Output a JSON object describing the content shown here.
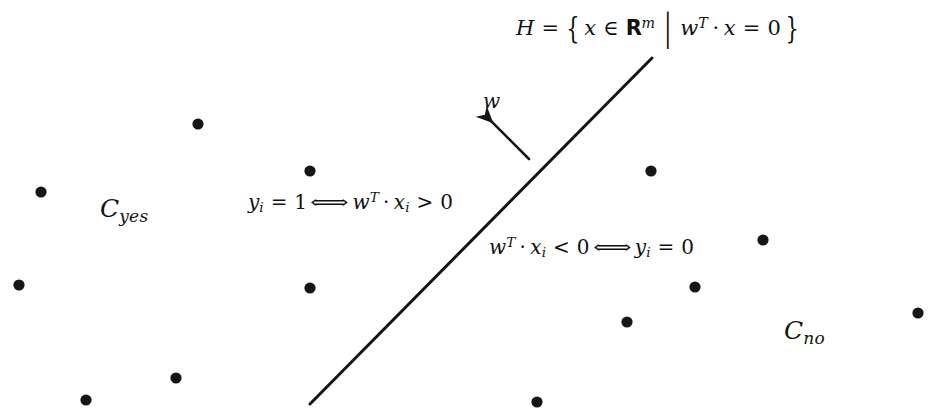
{
  "figure": {
    "title_note": "Linear classifier separating hyperplane diagram",
    "background_color": "#ffffff",
    "ink_color": "#111111",
    "labels": {
      "hyperplane": {
        "H": "H",
        "eq": "=",
        "brace_open": "{",
        "x": "x",
        "in": "∈",
        "R": "R",
        "m": "m",
        "vbar": "|",
        "w": "w",
        "T": "T",
        "dot": "·",
        "x2": "x",
        "eq2": "=",
        "zero": "0",
        "brace_close": "}",
        "plain": "H = { x ∈ R^m | w^T · x = 0 }"
      },
      "normal_vector": {
        "w": "w",
        "plain": "w"
      },
      "yes_rule": {
        "y": "y",
        "i": "i",
        "eq": "=",
        "one": "1",
        "iff": "⟺",
        "w": "w",
        "T": "T",
        "dot": "·",
        "x": "x",
        "i2": "i",
        "gt": ">",
        "zero": "0",
        "plain": "y_i = 1 ⟺ w^T · x_i > 0"
      },
      "no_rule": {
        "w": "w",
        "T": "T",
        "dot": "·",
        "x": "x",
        "i": "i",
        "lt": "<",
        "zero": "0",
        "iff": "⟺",
        "y": "y",
        "i2": "i",
        "eq": "=",
        "zero2": "0",
        "plain": "w^T · x_i < 0 ⟺ y_i = 0"
      },
      "class_yes": {
        "C": "C",
        "sub": "yes",
        "plain": "C_yes"
      },
      "class_no": {
        "C": "C",
        "sub": "no",
        "plain": "C_no"
      }
    },
    "hyperplane_line": {
      "x1": 310,
      "y1": 404,
      "x2": 652,
      "y2": 58,
      "stroke": "#141414",
      "stroke_width": 3
    },
    "normal_arrow": {
      "x1": 529,
      "y1": 159,
      "x2": 489,
      "y2": 119,
      "stroke": "#141414",
      "stroke_width": 2.6
    },
    "points": {
      "radius": 5.6,
      "fill": "#161616",
      "class_yes": [
        {
          "cx": 198,
          "cy": 124
        },
        {
          "cx": 41,
          "cy": 192
        },
        {
          "cx": 310,
          "cy": 171
        },
        {
          "cx": 19,
          "cy": 285
        },
        {
          "cx": 310,
          "cy": 288
        },
        {
          "cx": 176,
          "cy": 378
        },
        {
          "cx": 86,
          "cy": 400
        }
      ],
      "class_no": [
        {
          "cx": 651,
          "cy": 171
        },
        {
          "cx": 763,
          "cy": 240
        },
        {
          "cx": 695,
          "cy": 287
        },
        {
          "cx": 627,
          "cy": 322
        },
        {
          "cx": 918,
          "cy": 313
        },
        {
          "cx": 537,
          "cy": 402
        }
      ]
    }
  }
}
